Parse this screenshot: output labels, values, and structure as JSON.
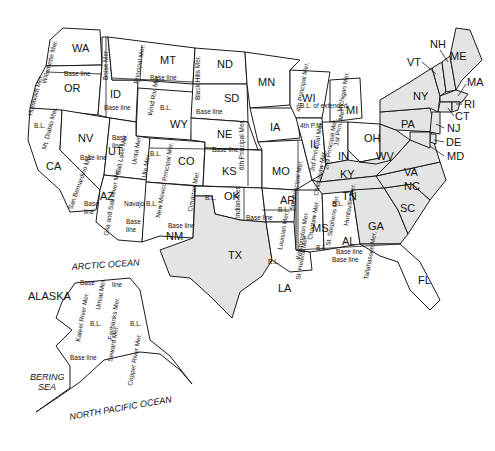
{
  "shading_color": "#e4e4e4",
  "line_color": "#1a1a1a",
  "shaded_states": [
    "ME",
    "NH",
    "VT",
    "MA",
    "RI",
    "CT",
    "NY",
    "PA",
    "NJ",
    "DE",
    "MD",
    "WV",
    "VA",
    "KY",
    "TN",
    "NC",
    "SC",
    "GA",
    "TX"
  ],
  "states": {
    "WA": "WA",
    "OR": "OR",
    "CA": "CA",
    "NV": "NV",
    "ID": "ID",
    "MT": "MT",
    "WY": "WY",
    "UT": "UT",
    "AZ": "AZ",
    "CO": "CO",
    "NM": "NM",
    "ND": "ND",
    "SD": "SD",
    "NE": "NE",
    "KS": "KS",
    "OK": "OK",
    "TX": "TX",
    "MN": "MN",
    "IA": "IA",
    "MO": "MO",
    "AR": "AR",
    "LA": "LA",
    "WI": "WI",
    "IL": "IL",
    "MI": "MI",
    "IN": "IN",
    "OH": "OH",
    "KY": "KY",
    "TN": "TN",
    "MS": "MS",
    "AL": "AL",
    "GA": "GA",
    "FL": "FL",
    "SC": "SC",
    "NC": "NC",
    "VA": "VA",
    "WV": "WV",
    "PA": "PA",
    "NY": "NY",
    "VT": "VT",
    "NH": "NH",
    "ME": "ME",
    "MA": "MA",
    "RI": "RI",
    "CT": "CT",
    "NJ": "NJ",
    "DE": "DE",
    "MD": "MD",
    "AK": "ALASKA"
  },
  "meridians": {
    "humboldt": "Humboldt Mer.",
    "willamette": "Willamette Mer.",
    "mt_diablo": "Mt. Diablo Mer.",
    "boise": "Boise Mer.",
    "principal": "Principal Mer.",
    "wind_river": "Wind Riv. Mer.",
    "black_hills": "Black Hills Mer.",
    "salt_lake": "Salt Lake Mer.",
    "uinta": "Uinta Mer.",
    "ute": "Ute Mer.",
    "san_bernardino": "San Bernardino Mer.",
    "gila": "Gila and Salt River Mer.",
    "navajo": "Navajo B.L.",
    "new_mexico": "New Mexico Principal Mer.",
    "cimarron": "Cimarron Mer.",
    "sixth": "6th Principal Mer.",
    "indian": "Indian Mer.",
    "fifth": "5th Principal Mer.",
    "fourth": "4th Principal Mer.",
    "fourth_pm": "4th P.M.",
    "third": "3rd Principal Mer.",
    "second": "2nd Principal Mer.",
    "first": "1st Prin. Mer.",
    "michigan": "Michigan Mer.",
    "louisiana": "Louisian Mer.",
    "washington": "Washington Mer.",
    "st_helena": "St. Helena Mer.",
    "choctaw": "Choctaw Mer.",
    "chickasaw": "Chickasaw Mer.",
    "st_stephens": "St. Stephens Mer.",
    "huntsville": "Huntsville Mer.",
    "tallahassee": "Tallahassee Mer.",
    "umiat": "Umiat Mer.",
    "kateel": "Kateel River Mer.",
    "fairbanks": "Fairbanks Mer.",
    "seward": "Seward Mer.",
    "copper": "Copper River Mer."
  },
  "baselines": {
    "base_line": "Base line",
    "bl": "B.L.",
    "base": "Base",
    "line": "line",
    "bl_extended": "B.L. of extended"
  },
  "oceans": {
    "arctic": "ARCTIC OCEAN",
    "bering": "BERING",
    "sea": "SEA",
    "north_pacific": "NORTH PACIFIC OCEAN"
  }
}
